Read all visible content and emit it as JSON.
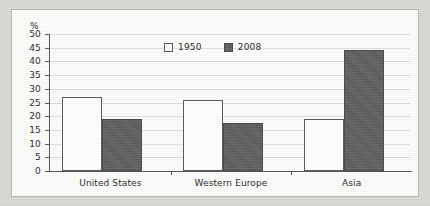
{
  "chart_data": {
    "type": "bar",
    "title": "",
    "subtitle": "",
    "xlabel": "",
    "ylabel": "%",
    "ylim": [
      0,
      50
    ],
    "ytick_step": 5,
    "yticks": [
      50,
      45,
      40,
      35,
      30,
      25,
      20,
      15,
      10,
      5,
      0
    ],
    "grid": true,
    "grid_axis": "y",
    "legend_position": "top-center",
    "categories": [
      "United States",
      "Western Europe",
      "Asia"
    ],
    "series": [
      {
        "name": "1950",
        "color": "#ffffff",
        "border_color": "#59595a",
        "values": [
          27,
          26,
          19
        ]
      },
      {
        "name": "2008",
        "color": "#5e5e5e",
        "border_color": "#4a4a4a",
        "values": [
          19,
          17.5,
          44
        ]
      }
    ]
  },
  "chart": {
    "unit_label": "%",
    "legend": [
      {
        "label": "1950",
        "swatch": "legend-swatch-1950"
      },
      {
        "label": "2008",
        "swatch": "legend-swatch-2008"
      }
    ],
    "y_axis": {
      "ticks": [
        "50",
        "45",
        "40",
        "35",
        "30",
        "25",
        "20",
        "15",
        "10",
        "5",
        "0"
      ]
    },
    "x_axis": {
      "categories": [
        "United States",
        "Western Europe",
        "Asia"
      ]
    }
  },
  "colors": {
    "series_1950": "#ffffff",
    "series_2008": "#5e5e5e",
    "axis": "#555553",
    "grid": "#dedede",
    "panel_background": "#fdfdfc",
    "outer_background": "#d9d9d6",
    "text": "#2b2b2b"
  }
}
